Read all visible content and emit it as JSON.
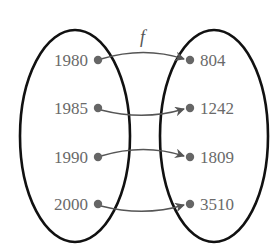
{
  "diagram": {
    "type": "function-mapping",
    "function_name": "f",
    "domain_set": {
      "values": [
        "1980",
        "1985",
        "1990",
        "2000"
      ]
    },
    "range_set": {
      "values": [
        "804",
        "1242",
        "1809",
        "3510"
      ]
    },
    "mappings": [
      {
        "from": "1980",
        "to": "804"
      },
      {
        "from": "1985",
        "to": "1242"
      },
      {
        "from": "1990",
        "to": "1809"
      },
      {
        "from": "2000",
        "to": "3510"
      }
    ],
    "colors": {
      "ellipse_stroke": "#111111",
      "dot": "#666666",
      "arrow": "#555555",
      "text": "#6a6a6a"
    }
  }
}
